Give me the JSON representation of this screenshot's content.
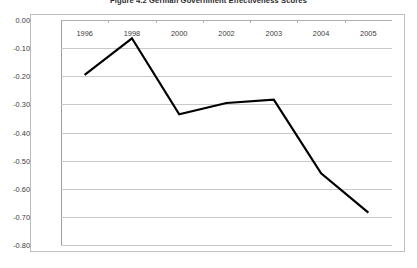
{
  "chart_data": {
    "type": "line",
    "title": "Figure 4.2  German Government Effectiveness Scores",
    "xlabel": "",
    "ylabel": "",
    "categories": [
      "1996",
      "1998",
      "2000",
      "2002",
      "2003",
      "2004",
      "2005"
    ],
    "values": [
      -0.195,
      -0.065,
      -0.335,
      -0.295,
      -0.283,
      -0.545,
      -0.685
    ],
    "series": [
      {
        "name": "Government Effectiveness",
        "values": [
          -0.195,
          -0.065,
          -0.335,
          -0.295,
          -0.283,
          -0.545,
          -0.685
        ]
      }
    ],
    "ylim": [
      -0.8,
      0.0
    ],
    "y_ticks": [
      "0.00",
      "-0.10",
      "-0.20",
      "-0.30",
      "-0.40",
      "-0.50",
      "-0.60",
      "-0.70",
      "-0.80"
    ],
    "y_tick_values": [
      0.0,
      -0.1,
      -0.2,
      -0.3,
      -0.4,
      -0.5,
      -0.6,
      -0.7,
      -0.8
    ],
    "grid": true,
    "legend": "none",
    "line_color": "#000000",
    "grid_color": "#c9c9c9",
    "axis_color": "#9e9e9e",
    "background": "#ffffff"
  }
}
